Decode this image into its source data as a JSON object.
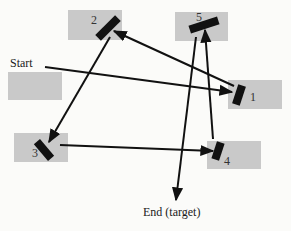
{
  "diagram": {
    "type": "mirror-reflection-path",
    "labels": {
      "start": "Start",
      "end": "End (target)"
    },
    "colors": {
      "box_fill": "#c9c9c9",
      "mirror": "#111111",
      "arrow": "#111111",
      "background": "#fbfbf9"
    },
    "boxes": [
      {
        "id": "start",
        "label": ""
      },
      {
        "id": "1",
        "label": "1"
      },
      {
        "id": "2",
        "label": "2"
      },
      {
        "id": "3",
        "label": "3"
      },
      {
        "id": "4",
        "label": "4"
      },
      {
        "id": "5",
        "label": "5"
      }
    ],
    "path_order": [
      "Start",
      "1",
      "2",
      "3",
      "4",
      "5",
      "End (target)"
    ]
  }
}
